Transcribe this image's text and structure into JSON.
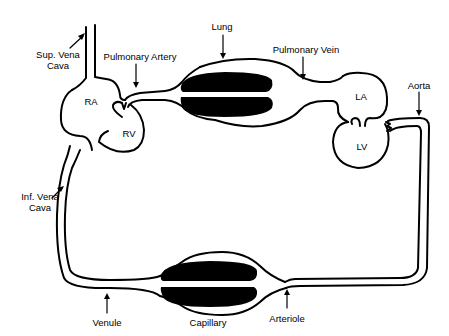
{
  "labels": {
    "sup_vena_cava_line1": "Sup. Vena",
    "sup_vena_cava_line2": "Cava",
    "pulmonary_artery": "Pulmonary Artery",
    "lung": "Lung",
    "pulmonary_vein": "Pulmonary Vein",
    "aorta": "Aorta",
    "ra": "RA",
    "rv": "RV",
    "la": "LA",
    "lv": "LV",
    "inf_vena_cava_line1": "Inf. Vena",
    "inf_vena_cava_line2": "Cava",
    "venule": "Venule",
    "capillary": "Capillary",
    "arteriole": "Arteriole"
  },
  "colors": {
    "line": "#000000",
    "background": "#ffffff",
    "tissue_fill": "#000000"
  }
}
